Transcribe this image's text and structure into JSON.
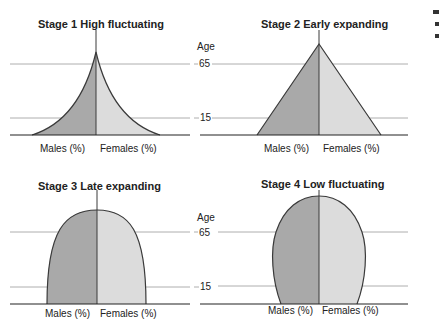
{
  "panels": [
    {
      "id": "stage1",
      "title": "Stage 1 High fluctuating",
      "shape": "concave-pyramid",
      "x_labels": [
        "Males (%)",
        "Females (%)"
      ]
    },
    {
      "id": "stage2",
      "title": "Stage 2 Early expanding",
      "shape": "triangle",
      "x_labels": [
        "Males (%)",
        "Females (%)"
      ]
    },
    {
      "id": "stage3",
      "title": "Stage 3 Late expanding",
      "shape": "parabola",
      "x_labels": [
        "Males (%)",
        "Females (%)"
      ]
    },
    {
      "id": "stage4",
      "title": "Stage 4 Low fluctuating",
      "shape": "ellipse",
      "x_labels": [
        "Males (%)",
        "Females (%)"
      ]
    }
  ],
  "age_axis": {
    "label": "Age",
    "ticks": [
      "65",
      "15"
    ]
  },
  "colors": {
    "males": "#a9a9a9",
    "females": "#dcdcdc",
    "outline": "#3a3a3a",
    "gridline": "#9a9a9a"
  }
}
